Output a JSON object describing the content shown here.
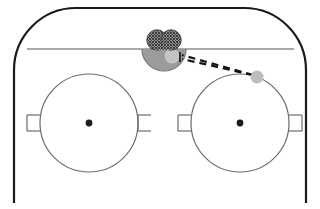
{
  "diagram": {
    "type": "ice-hockey-offensive-zone-schematic",
    "width": 320,
    "height": 209,
    "background_color": "#ffffff"
  },
  "colors": {
    "boards_line": "#1a1a1a",
    "goal_line": "#8c8c8c",
    "circle_line": "#6b6b6b",
    "faceoff_dot": "#1c1c1c",
    "crease_fill": "#9b9b9b",
    "crease_stroke": "#7a7a7a",
    "net_fill": "#8e8e8e",
    "net_hatch": "#4a4a4a",
    "goalie_fill": "#c4c4c4",
    "puck_fill": "#bdbdbd",
    "trajectory": "#141414"
  },
  "rink": {
    "boards": {
      "name": "rink boards outline",
      "stroke_width": 2.2,
      "corner_radius": 62,
      "left_x": 14,
      "right_x": 306,
      "top_y": 8,
      "bottom_y": 203
    },
    "goal_line": {
      "name": "goal line",
      "y": 49,
      "x_start": 27,
      "x_end": 294,
      "stroke_width": 1.2
    }
  },
  "goal": {
    "net": {
      "name": "goal net",
      "center_x": 164,
      "center_y": 40,
      "lobe_radius": 10.5,
      "lobe_offset": 7.5,
      "hatch_spacing": 3
    },
    "crease": {
      "name": "goal crease",
      "center_x": 164,
      "center_y": 49,
      "radius": 22,
      "orientation": "below-goal-line"
    },
    "goalie": {
      "name": "goalie marker",
      "cx": 172,
      "cy": 56,
      "r": 7.5
    }
  },
  "faceoff_circles": [
    {
      "id": "left",
      "label": "left faceoff circle",
      "cx": 89,
      "cy": 123,
      "radius": 49,
      "dot_radius": 3.4,
      "hash_marks": [
        {
          "side": "left",
          "y_offset": -8,
          "x_inner": -49,
          "x_outer": -62
        },
        {
          "side": "left",
          "y_offset": 8,
          "x_inner": -49,
          "x_outer": -62
        },
        {
          "side": "right",
          "y_offset": -8,
          "x_inner": 49,
          "x_outer": 62
        },
        {
          "side": "right",
          "y_offset": 8,
          "x_inner": 49,
          "x_outer": 62
        }
      ]
    },
    {
      "id": "right",
      "label": "right faceoff circle",
      "cx": 240,
      "cy": 123,
      "radius": 49,
      "dot_radius": 3.4,
      "hash_marks": [
        {
          "side": "left",
          "y_offset": -8,
          "x_inner": -49,
          "x_outer": -62
        },
        {
          "side": "left",
          "y_offset": 8,
          "x_inner": -49,
          "x_outer": -62
        },
        {
          "side": "right",
          "y_offset": -8,
          "x_inner": 49,
          "x_outer": 62
        },
        {
          "side": "right",
          "y_offset": 8,
          "x_inner": 49,
          "x_outer": 62
        }
      ]
    }
  ],
  "trajectory": {
    "name": "puck trajectory",
    "style": "double-dashed",
    "dash_pattern": "7 5",
    "stroke_width": 2.2,
    "line_a": {
      "x1": 253,
      "y1": 75,
      "x2": 182,
      "y2": 55
    },
    "line_b": {
      "x1": 253,
      "y1": 75,
      "x2": 182,
      "y2": 59
    },
    "arrow_tip_x": 180,
    "arrow_tip_y": 57
  },
  "puck": {
    "name": "puck marker",
    "cx": 257,
    "cy": 77,
    "r": 6.5
  }
}
